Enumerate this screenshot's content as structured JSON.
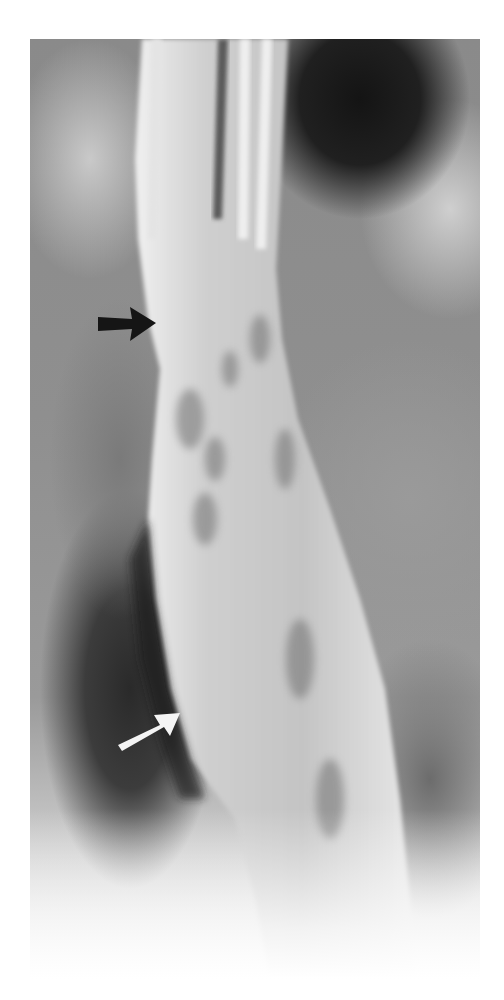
{
  "figure": {
    "type": "radiograph",
    "colors": {
      "background": "#ffffff",
      "lumen": "#d6d6d6",
      "dark_soft_tissue": "#1c1c1c",
      "mid_tone": "#8c8c8c"
    },
    "annotations": [
      {
        "name": "upper-arrow",
        "color": "#1a1a1a",
        "direction": "right",
        "tip": [
          155,
          322
        ]
      },
      {
        "name": "lower-arrow",
        "color": "#f2f2f2",
        "direction": "up-right",
        "tip": [
          180,
          712
        ]
      }
    ]
  }
}
